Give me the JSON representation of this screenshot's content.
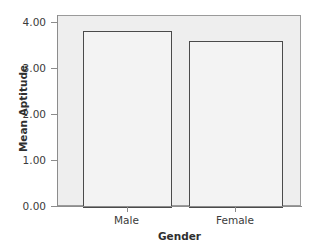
{
  "chart_data": {
    "type": "bar",
    "title": "",
    "categories": [
      "Male",
      "Female"
    ],
    "values": [
      3.83,
      3.61
    ],
    "xlabel": "Gender",
    "ylabel": "Mean Aptitude",
    "ylim": [
      0.0,
      4.25
    ],
    "ytick_values": [
      0.0,
      1.0,
      2.0,
      3.0,
      4.0
    ],
    "ytick_labels": [
      "0.00",
      "1.00",
      "2.00",
      "3.00",
      "4.00"
    ],
    "grid": false,
    "legend": null,
    "series": [
      {
        "name": "Mean Aptitude",
        "values": [
          3.83,
          3.61
        ]
      }
    ],
    "colors": {
      "plot_background": "#eeeeee",
      "bar_fill": "#f3f3f3",
      "bar_outline": "#4a4a4a",
      "axis_line": "#8c8c8c",
      "frame_border": "#9a9a9a",
      "text": "#3b3b3b",
      "title_text": "#2f2f2f",
      "canvas_background": "#ffffff"
    }
  },
  "axes": {
    "y": {
      "label": "Mean Aptitude",
      "ticks": [
        {
          "label": "4.00",
          "value": 4.0
        },
        {
          "label": "3.00",
          "value": 3.0
        },
        {
          "label": "2.00",
          "value": 2.0
        },
        {
          "label": "1.00",
          "value": 1.0
        },
        {
          "label": "0.00",
          "value": 0.0
        }
      ]
    },
    "x": {
      "label": "Gender",
      "ticks": [
        {
          "label": "Male"
        },
        {
          "label": "Female"
        }
      ]
    }
  },
  "bars": [
    {
      "category": "Male",
      "value": 3.83
    },
    {
      "category": "Female",
      "value": 3.61
    }
  ]
}
